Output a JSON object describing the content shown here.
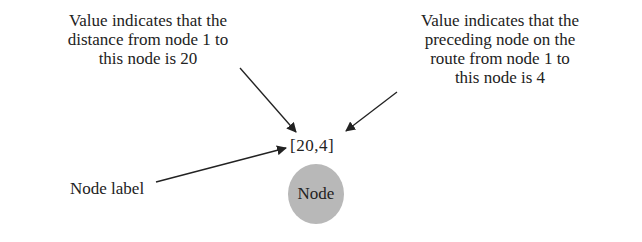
{
  "diagram": {
    "caption_left": {
      "lines": [
        "Value indicates that the",
        "distance from node 1 to",
        "this node is 20"
      ]
    },
    "caption_right": {
      "lines": [
        "Value indicates that the",
        "preceding node on the",
        "route from node 1 to",
        "this node is 4"
      ]
    },
    "node_label_caption": "Node label",
    "value_label": "[20,4]",
    "node_text": "Node",
    "colors": {
      "node_fill": "#b8b8b8",
      "text": "#222222",
      "arrow": "#222222"
    }
  }
}
